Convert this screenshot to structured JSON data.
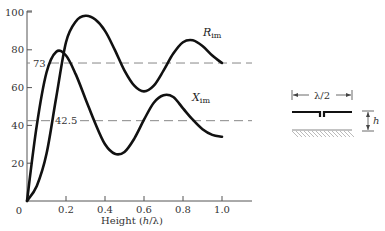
{
  "chart_data": {
    "type": "line",
    "title": "",
    "xlabel": "Height (h/λ)",
    "ylabel": "",
    "xlim": [
      0,
      1.0
    ],
    "ylim": [
      0,
      100
    ],
    "x_ticks": [
      "0",
      "0.2",
      "0.4",
      "0.6",
      "0.8",
      "1.0"
    ],
    "y_ticks": [
      "20",
      "40",
      "60",
      "80",
      "100"
    ],
    "grid": false,
    "x": [
      0,
      0.05,
      0.1,
      0.15,
      0.2,
      0.25,
      0.3,
      0.35,
      0.4,
      0.45,
      0.5,
      0.55,
      0.6,
      0.65,
      0.7,
      0.75,
      0.8,
      0.85,
      0.9,
      0.95,
      1.0
    ],
    "series": [
      {
        "name": "R_im",
        "label_main": "R",
        "label_sub": "im",
        "values": [
          0,
          8,
          25,
          55,
          84,
          95,
          98,
          96,
          90,
          80,
          69,
          61,
          58,
          61,
          69,
          78,
          84,
          85,
          82,
          77,
          73
        ]
      },
      {
        "name": "X_im",
        "label_main": "X",
        "label_sub": "im",
        "values": [
          0,
          40,
          68,
          79,
          77,
          67,
          54,
          41,
          30,
          25,
          26,
          33,
          43,
          52,
          56,
          55,
          49,
          43,
          38,
          35,
          34
        ]
      }
    ],
    "reference_lines": [
      {
        "value": 73,
        "label": "73"
      },
      {
        "value": 42.5,
        "label": "42.5"
      }
    ],
    "annotations": [
      "R_im",
      "X_im",
      "73",
      "42.5"
    ],
    "inset_diagram": {
      "description": "Half-wave dipole at height h above ground plane",
      "length_label": "λ/2",
      "height_label": "h"
    }
  },
  "labels": {
    "x_origin": "0",
    "x_axis_title_prefix": "Height (",
    "x_axis_title_var": "h",
    "x_axis_title_suffix": "/λ)",
    "inset_length": "λ/2",
    "inset_height": "h"
  }
}
